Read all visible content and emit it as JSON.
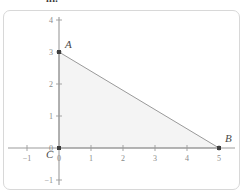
{
  "header": {
    "fragment_text": "iii."
  },
  "figure": {
    "title": "",
    "frame_color": "#d8d8d8",
    "background": "#ffffff"
  },
  "chart_data": {
    "type": "scatter",
    "title": "",
    "xlabel": "",
    "ylabel": "",
    "xlim": [
      -1.6,
      6.0
    ],
    "ylim": [
      -1.5,
      4.5
    ],
    "grid": false,
    "legend": null,
    "axis_color": "#9b9b9b",
    "x_ticks": [
      -1,
      0,
      1,
      2,
      3,
      4,
      5
    ],
    "x_tick_labels": [
      "−1",
      "0",
      "1",
      "2",
      "3",
      "4",
      "5"
    ],
    "y_ticks": [
      -1,
      0,
      1,
      2,
      3,
      4
    ],
    "y_tick_labels": [
      "−1",
      "0",
      "1",
      "2",
      "3",
      "4"
    ],
    "points": [
      {
        "name": "A",
        "label": "A",
        "x": 0,
        "y": 3,
        "label_dx": 6,
        "label_dy": -4
      },
      {
        "name": "B",
        "label": "B",
        "x": 5,
        "y": 0,
        "label_dx": 6,
        "label_dy": -6
      },
      {
        "name": "C",
        "label": "C",
        "x": 0,
        "y": 0,
        "label_dx": -13,
        "label_dy": 10
      }
    ],
    "shapes": [
      {
        "name": "triangle-ABC",
        "type": "polygon",
        "vertices": [
          [
            0,
            3
          ],
          [
            5,
            0
          ],
          [
            0,
            0
          ]
        ],
        "fill": "#f4f4f4",
        "stroke": "#8f8f8f"
      }
    ],
    "series": [
      {
        "name": "triangle-vertices",
        "x": [
          0,
          5,
          0
        ],
        "y": [
          3,
          0,
          0
        ],
        "labels": [
          "A",
          "B",
          "C"
        ],
        "marker_color": "#4a4a4a"
      }
    ]
  }
}
